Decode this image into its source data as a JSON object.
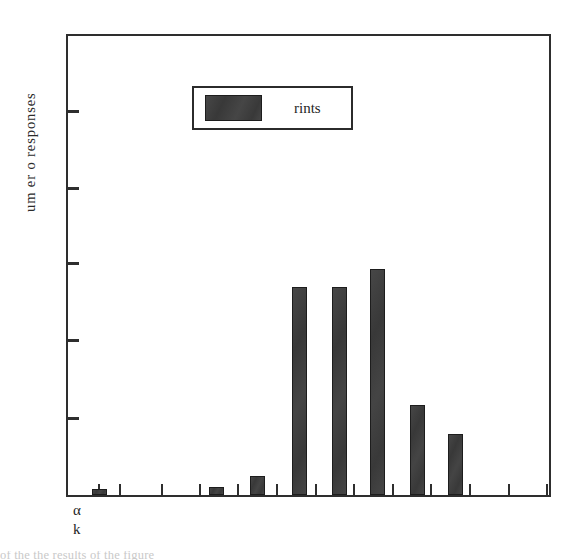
{
  "figure": {
    "background_color": "#ffffff",
    "frame_color": "#2e2e2e",
    "bar_color": "#3c3c3c",
    "bar_edge_color": "#1d1d1d"
  },
  "axes": {
    "ylabel_text": "um er o responses",
    "below_axis_glyphs": {
      "alpha": "α",
      "k": "k"
    }
  },
  "legend": {
    "entry_label": "rints",
    "swatch_color": "#3c3c3c"
  },
  "caption_strip": {
    "text": "of the the results of the figure"
  },
  "chart_data": {
    "type": "bar",
    "title": "",
    "xlabel": "",
    "ylabel": "um er o responses",
    "grid": false,
    "legend_position": "upper-left-inside",
    "series": [
      {
        "name": "rints",
        "color": "#3c3c3c",
        "values": [
          0.8,
          0,
          1,
          2.5,
          27,
          27,
          29,
          12,
          8,
          0,
          0,
          0,
          0
        ]
      }
    ],
    "categories": [
      "1",
      "2",
      "3",
      "4",
      "5",
      "6",
      "7",
      "8",
      "9",
      "10",
      "11",
      "12",
      "13"
    ],
    "ylim": [
      0,
      60
    ],
    "ytick_values": [
      0,
      10,
      20,
      30,
      40,
      50,
      60
    ],
    "ytick_labels": [
      "",
      "",
      "",
      "",
      "",
      "",
      ""
    ],
    "xtick_labels": [
      "",
      "",
      "",
      "",
      "",
      "",
      "",
      "",
      "",
      "",
      "",
      "",
      ""
    ],
    "bars": [
      {
        "index": 1,
        "value": 0.8,
        "bar_x_px": 90,
        "bar_top_px": 491,
        "bar_height_px": 6
      },
      {
        "index": 2,
        "value": 0,
        "bar_x_px": 0,
        "bar_top_px": 497,
        "bar_height_px": 0
      },
      {
        "index": 3,
        "value": 1,
        "bar_x_px": 207,
        "bar_top_px": 489,
        "bar_height_px": 8
      },
      {
        "index": 4,
        "value": 2.5,
        "bar_x_px": 248,
        "bar_top_px": 478,
        "bar_height_px": 19
      },
      {
        "index": 5,
        "value": 27,
        "bar_x_px": 290,
        "bar_top_px": 289,
        "bar_height_px": 208
      },
      {
        "index": 6,
        "value": 27,
        "bar_x_px": 330,
        "bar_top_px": 289,
        "bar_height_px": 208
      },
      {
        "index": 7,
        "value": 29,
        "bar_x_px": 368,
        "bar_top_px": 271,
        "bar_height_px": 226
      },
      {
        "index": 8,
        "value": 12,
        "bar_x_px": 408,
        "bar_top_px": 407,
        "bar_height_px": 90
      },
      {
        "index": 9,
        "value": 8,
        "bar_x_px": 446,
        "bar_top_px": 436,
        "bar_height_px": 61
      }
    ]
  },
  "geometry": {
    "plot_left_px": 66,
    "plot_top_px": 34,
    "plot_width_px": 485,
    "plot_height_px": 463,
    "bar_width_px": 15,
    "y_tick_px": [
      74,
      151,
      226,
      303,
      381
    ],
    "x_tick_px": [
      30,
      51,
      93,
      131,
      169,
      208,
      247,
      285,
      324,
      362,
      401,
      440,
      478
    ]
  }
}
